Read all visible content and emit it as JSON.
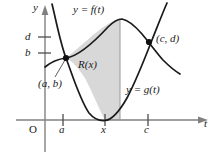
{
  "figure": {
    "type": "math-graph",
    "axes": {
      "x_axis_label": "t",
      "y_axis_label": "y",
      "origin_label": "O",
      "y_ticks": [
        {
          "label": "d",
          "name": "y-tick-d"
        },
        {
          "label": "b",
          "name": "y-tick-b"
        }
      ],
      "x_ticks": [
        {
          "label": "a",
          "name": "x-tick-a"
        },
        {
          "label": "x",
          "name": "x-tick-x"
        },
        {
          "label": "c",
          "name": "x-tick-c"
        }
      ]
    },
    "curves": [
      {
        "name": "curve-f",
        "label": "y = f(t)"
      },
      {
        "name": "curve-g",
        "label": "y = g(t)"
      }
    ],
    "region": {
      "label": "R(x)",
      "fill_color": "#d8d8d8"
    },
    "points": [
      {
        "name": "point-ab",
        "label": "(a, b)"
      },
      {
        "name": "point-cd",
        "label": "(c, d)"
      }
    ],
    "colors": {
      "axis": "#808080",
      "curve": "#1a1a1a",
      "shade": "#d8d8d8",
      "text": "#1a1a1a"
    }
  }
}
